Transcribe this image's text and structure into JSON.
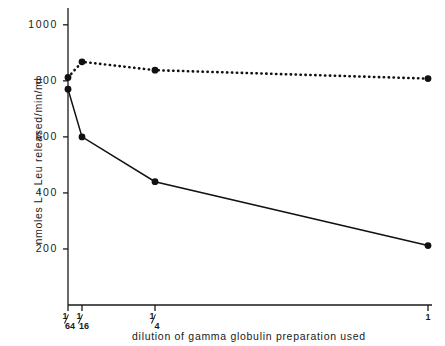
{
  "chart_data": {
    "type": "line",
    "title": "",
    "xlabel": "dilution of gamma globulin preparation used",
    "ylabel": "nmoles L - Leu released/min/ml",
    "x_tick_labels": [
      "1/64",
      "1/16",
      "1/4",
      "1"
    ],
    "x_tick_numerators": [
      "1",
      "1",
      "1",
      "1"
    ],
    "x_tick_denominators": [
      "64",
      "16",
      "4",
      ""
    ],
    "y_tick_labels": [
      "200",
      "400",
      "600",
      "800",
      "1000"
    ],
    "y_ticks": [
      200,
      400,
      600,
      800,
      1000
    ],
    "ylim": [
      0,
      1060
    ],
    "grid": false,
    "legend": "none",
    "categories": [
      "1/64",
      "1/16",
      "1/4",
      "1"
    ],
    "series": [
      {
        "name": "dotted-series",
        "style": "dotted",
        "marker": "filled-circle",
        "color": "#111111",
        "values": [
          812,
          868,
          838,
          808
        ]
      },
      {
        "name": "solid-series",
        "style": "solid",
        "marker": "filled-circle",
        "color": "#111111",
        "values": [
          770,
          600,
          440,
          212
        ]
      }
    ]
  },
  "axes": {
    "y_axis_name": "y-axis",
    "x_axis_name": "x-axis"
  }
}
